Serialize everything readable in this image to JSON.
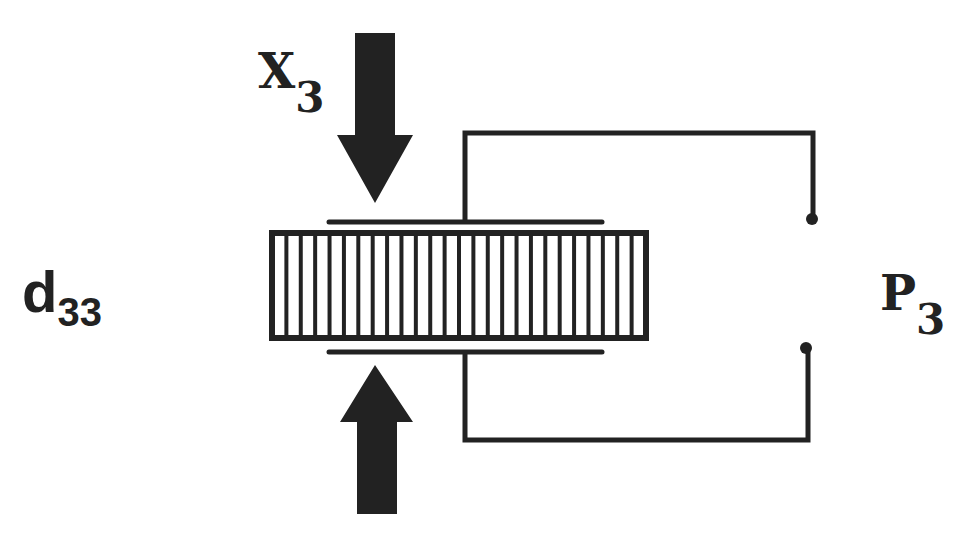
{
  "diagram": {
    "title_label": {
      "main": "d",
      "sub": "33"
    },
    "stress_label": {
      "main": "X",
      "sub": "3"
    },
    "polarization_label": {
      "main": "P",
      "sub": "3"
    },
    "colors": {
      "ink": "#222222",
      "background": "#ffffff"
    },
    "block": {
      "x": 270,
      "y": 231,
      "width": 378,
      "height": 109,
      "stripe_count": 25
    },
    "arrows": [
      {
        "name": "top-force-arrow",
        "direction": "down"
      },
      {
        "name": "bottom-force-arrow",
        "direction": "up"
      }
    ],
    "electrodes": [
      "top-electrode",
      "bottom-electrode"
    ],
    "terminals": [
      "top-terminal",
      "bottom-terminal"
    ]
  }
}
